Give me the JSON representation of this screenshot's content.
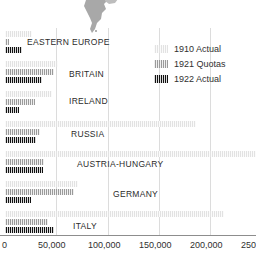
{
  "chart_data": {
    "type": "bar",
    "orientation": "horizontal",
    "title": "",
    "xlabel": "",
    "ylabel": "",
    "xlim": [
      0,
      256000
    ],
    "xticks": [
      0,
      50000,
      100000,
      150000,
      200000,
      250000
    ],
    "xtick_labels": [
      "0",
      "50,000",
      "100,000",
      "150,000",
      "200,000",
      "250,000"
    ],
    "grid": "vertical",
    "legend_position": "top-right",
    "categories": [
      "Eastern Europe",
      "Britain",
      "Ireland",
      "Russia",
      "Austria-Hungary",
      "Germany",
      "Italy"
    ],
    "series": [
      {
        "name": "1910 Actual",
        "color": "#e2e2e2",
        "values": [
          26000,
          52000,
          46000,
          187000,
          255000,
          72000,
          215000
        ]
      },
      {
        "name": "1921 Quotas",
        "color": "#9a9a9a",
        "values": [
          3500,
          48000,
          29000,
          34000,
          38000,
          68000,
          42000
        ]
      },
      {
        "name": "1922 Actual",
        "color": "#111111",
        "values": [
          17000,
          36000,
          14000,
          30000,
          37000,
          25000,
          48000
        ]
      }
    ]
  },
  "legend": {
    "items": [
      {
        "label": "1910 Actual",
        "color": "#e2e2e2"
      },
      {
        "label": "1921 Quotas",
        "color": "#9a9a9a"
      },
      {
        "label": "1922 Actual",
        "color": "#111111"
      }
    ]
  },
  "axis": {
    "ticks": [
      {
        "label": "0",
        "value": 0
      },
      {
        "label": "50,000",
        "value": 50000
      },
      {
        "label": "100,000",
        "value": 100000
      },
      {
        "label": "150,000",
        "value": 150000
      },
      {
        "label": "200,000",
        "value": 200000
      },
      {
        "label": "250,000",
        "value": 250000
      }
    ]
  },
  "decoration": {
    "map_name": "americas-map-silhouette",
    "map_color": "#a8a8a8"
  },
  "colors": {
    "gridline": "#dcdcdc",
    "axis": "#8d8d8d",
    "text": "#2f2f2f",
    "background": "#ffffff"
  }
}
